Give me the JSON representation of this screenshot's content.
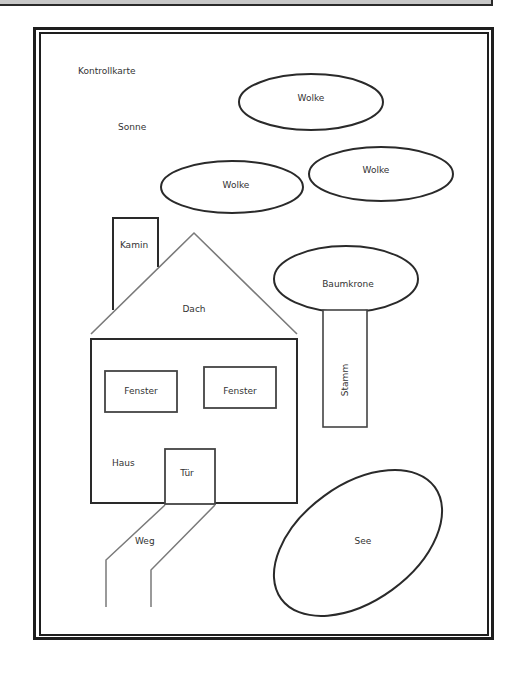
{
  "title": "Kontrollkarte",
  "colors": {
    "line_dark": "#2a2a2a",
    "line_gray": "#7a7a7a",
    "text": "#333333",
    "background": "#ffffff",
    "top_strip": "#c8c8c8"
  },
  "labels": {
    "kontrollkarte": "Kontrollkarte",
    "sonne": "Sonne",
    "wolke_1": "Wolke",
    "wolke_2": "Wolke",
    "wolke_3": "Wolke",
    "kamin": "Kamin",
    "dach": "Dach",
    "baumkrone": "Baumkrone",
    "stamm": "Stamm",
    "fenster_1": "Fenster",
    "fenster_2": "Fenster",
    "haus": "Haus",
    "tuer": "Tür",
    "weg": "Weg",
    "see": "See"
  }
}
